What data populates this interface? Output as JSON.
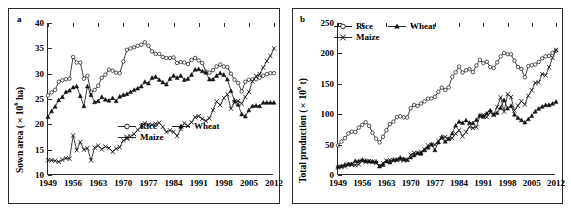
{
  "figure": {
    "background": "#ffffff",
    "line_color": "#111111"
  },
  "panels": [
    {
      "letter": "a",
      "ylabel_main": "Sown area (×10",
      "ylabel_sup": "6",
      "ylabel_tail": "  ha)",
      "ylabel_full": "Sown area (×10^6 ha)"
    },
    {
      "letter": "b",
      "ylabel_main": "Total production (×10",
      "ylabel_sup": "6",
      "ylabel_tail": "  t)",
      "ylabel_full": "Total production (×10^6 t)"
    }
  ],
  "legend": {
    "rice": "Rice",
    "wheat": "Wheat",
    "maize": "Maize",
    "rice_marker": "open-circle-marker",
    "wheat_marker": "filled-triangle-marker",
    "maize_marker": "cross-marker"
  },
  "chart_data": [
    {
      "type": "line",
      "panel": "a",
      "title": "",
      "xlabel": "",
      "ylabel": "Sown area (×10^6 ha)",
      "xlim": [
        1949,
        2012
      ],
      "ylim": [
        10,
        40
      ],
      "yticks": [
        10,
        15,
        20,
        25,
        30,
        35,
        40
      ],
      "xticks": [
        1949,
        1956,
        1963,
        1970,
        1977,
        1984,
        1991,
        1998,
        2005,
        2012
      ],
      "grid": false,
      "legend_position": "inside-lower-right",
      "x": [
        1949,
        1950,
        1951,
        1952,
        1953,
        1954,
        1955,
        1956,
        1957,
        1958,
        1959,
        1960,
        1961,
        1962,
        1963,
        1964,
        1965,
        1966,
        1967,
        1968,
        1969,
        1970,
        1971,
        1972,
        1973,
        1974,
        1975,
        1976,
        1977,
        1978,
        1979,
        1980,
        1981,
        1982,
        1983,
        1984,
        1985,
        1986,
        1987,
        1988,
        1989,
        1990,
        1991,
        1992,
        1993,
        1994,
        1995,
        1996,
        1997,
        1998,
        1999,
        2000,
        2001,
        2002,
        2003,
        2004,
        2005,
        2006,
        2007,
        2008,
        2009,
        2010,
        2011,
        2012
      ],
      "series": [
        {
          "name": "Rice",
          "marker": "open-circle",
          "values": [
            25.7,
            26.3,
            26.8,
            28.4,
            28.7,
            28.9,
            29.0,
            33.3,
            32.2,
            32.2,
            29.0,
            29.6,
            26.3,
            26.8,
            27.6,
            29.2,
            29.8,
            30.8,
            30.6,
            30.2,
            30.1,
            32.4,
            34.7,
            35.0,
            35.2,
            35.5,
            35.7,
            36.2,
            35.5,
            34.4,
            33.9,
            33.9,
            33.3,
            33.1,
            33.1,
            33.2,
            32.1,
            32.3,
            32.2,
            31.9,
            32.7,
            33.1,
            32.6,
            32.1,
            30.4,
            30.2,
            30.7,
            31.4,
            31.8,
            31.4,
            31.3,
            30.0,
            28.8,
            28.2,
            26.5,
            28.4,
            28.8,
            28.9,
            28.9,
            29.2,
            29.6,
            29.9,
            30.1,
            30.1
          ]
        },
        {
          "name": "Wheat",
          "marker": "filled-triangle",
          "values": [
            21.5,
            22.6,
            23.5,
            24.8,
            25.4,
            26.4,
            26.7,
            27.3,
            27.5,
            25.6,
            23.6,
            27.5,
            25.8,
            24.4,
            24.6,
            25.4,
            24.9,
            24.7,
            25.2,
            24.6,
            25.5,
            25.8,
            26.0,
            26.4,
            26.8,
            27.1,
            27.5,
            28.4,
            28.1,
            29.2,
            29.4,
            28.8,
            28.3,
            27.9,
            29.0,
            29.6,
            29.2,
            29.6,
            28.8,
            29.0,
            29.8,
            30.8,
            30.9,
            30.5,
            30.2,
            28.9,
            28.9,
            29.6,
            30.1,
            29.8,
            28.9,
            26.6,
            24.7,
            23.9,
            22.0,
            21.6,
            22.8,
            23.6,
            23.7,
            23.6,
            24.3,
            24.3,
            24.3,
            24.3
          ]
        },
        {
          "name": "Maize",
          "marker": "cross",
          "values": [
            12.9,
            12.9,
            12.8,
            12.6,
            13.0,
            13.3,
            13.2,
            17.8,
            14.9,
            16.5,
            15.0,
            15.3,
            12.9,
            15.4,
            15.8,
            15.1,
            15.6,
            15.3,
            14.6,
            15.2,
            15.5,
            16.8,
            17.2,
            17.6,
            18.1,
            18.9,
            19.6,
            20.2,
            19.9,
            19.9,
            20.1,
            20.3,
            19.5,
            18.5,
            18.8,
            18.5,
            17.7,
            19.1,
            20.2,
            19.7,
            20.4,
            21.4,
            21.6,
            21.1,
            20.7,
            21.2,
            22.8,
            24.5,
            23.8,
            25.2,
            25.9,
            23.1,
            24.3,
            24.6,
            24.1,
            25.4,
            26.4,
            28.5,
            29.5,
            29.9,
            31.2,
            32.5,
            33.5,
            35.0
          ]
        }
      ]
    },
    {
      "type": "line",
      "panel": "b",
      "title": "",
      "xlabel": "",
      "ylabel": "Total production (×10^6 t)",
      "xlim": [
        1949,
        2012
      ],
      "ylim": [
        0,
        250
      ],
      "yticks": [
        0,
        50,
        100,
        150,
        200,
        250
      ],
      "xticks": [
        1949,
        1956,
        1963,
        1970,
        1977,
        1984,
        1991,
        1998,
        2005,
        2012
      ],
      "grid": false,
      "legend_position": "inside-upper-left",
      "x": [
        1949,
        1950,
        1951,
        1952,
        1953,
        1954,
        1955,
        1956,
        1957,
        1958,
        1959,
        1960,
        1961,
        1962,
        1963,
        1964,
        1965,
        1966,
        1967,
        1968,
        1969,
        1970,
        1971,
        1972,
        1973,
        1974,
        1975,
        1976,
        1977,
        1978,
        1979,
        1980,
        1981,
        1982,
        1983,
        1984,
        1985,
        1986,
        1987,
        1988,
        1989,
        1990,
        1991,
        1992,
        1993,
        1994,
        1995,
        1996,
        1997,
        1998,
        1999,
        2000,
        2001,
        2002,
        2003,
        2004,
        2005,
        2006,
        2007,
        2008,
        2009,
        2010,
        2011,
        2012
      ],
      "series": [
        {
          "name": "Rice",
          "marker": "open-circle",
          "values": [
            48.6,
            55.0,
            60.6,
            68.4,
            71.3,
            70.8,
            78.0,
            82.5,
            86.8,
            80.8,
            69.4,
            59.7,
            53.6,
            62.9,
            73.7,
            83.6,
            87.7,
            95.4,
            96.6,
            94.9,
            94.6,
            109.9,
            115.2,
            113.6,
            117.7,
            121.0,
            125.6,
            125.8,
            128.6,
            136.9,
            143.7,
            139.9,
            144.0,
            161.6,
            168.9,
            178.3,
            168.6,
            172.2,
            174.3,
            169.1,
            180.1,
            189.3,
            183.8,
            186.2,
            177.5,
            175.9,
            185.2,
            195.1,
            200.7,
            198.7,
            198.5,
            187.9,
            177.6,
            174.5,
            160.7,
            179.1,
            180.6,
            181.7,
            186.0,
            191.9,
            195.1,
            195.8,
            200.8,
            204.2
          ]
        },
        {
          "name": "Wheat",
          "marker": "filled-triangle",
          "values": [
            13.8,
            14.8,
            17.1,
            18.1,
            18.3,
            23.3,
            22.9,
            24.8,
            23.6,
            22.6,
            22.2,
            22.2,
            14.3,
            16.7,
            22.6,
            20.8,
            25.2,
            25.3,
            28.5,
            26.5,
            25.1,
            29.2,
            32.6,
            35.9,
            35.2,
            40.9,
            45.3,
            50.3,
            41.0,
            53.8,
            62.7,
            55.2,
            59.6,
            68.5,
            81.4,
            87.8,
            85.8,
            90.0,
            85.9,
            85.4,
            90.8,
            98.2,
            96.0,
            101.6,
            106.4,
            99.3,
            102.2,
            110.6,
            123.3,
            109.7,
            113.9,
            99.6,
            93.9,
            90.3,
            86.5,
            92.0,
            97.4,
            104.5,
            109.3,
            112.5,
            115.1,
            115.2,
            117.4,
            120.6
          ]
        },
        {
          "name": "Maize",
          "marker": "cross",
          "values": [
            12.4,
            13.2,
            14.0,
            16.9,
            16.8,
            16.6,
            17.5,
            23.3,
            21.4,
            23.0,
            21.6,
            19.6,
            14.9,
            19.6,
            23.3,
            24.6,
            23.7,
            25.0,
            25.2,
            24.1,
            25.0,
            33.0,
            36.3,
            35.9,
            38.0,
            42.2,
            48.6,
            49.3,
            49.7,
            55.9,
            60.0,
            62.6,
            59.2,
            60.6,
            68.2,
            73.4,
            63.8,
            70.9,
            79.2,
            77.4,
            78.9,
            96.8,
            98.8,
            95.4,
            102.7,
            99.3,
            112.0,
            127.5,
            104.3,
            133.0,
            128.1,
            106.0,
            114.1,
            121.3,
            115.8,
            130.3,
            139.4,
            151.6,
            152.3,
            166.0,
            163.9,
            177.2,
            192.8,
            205.6
          ]
        }
      ]
    }
  ]
}
